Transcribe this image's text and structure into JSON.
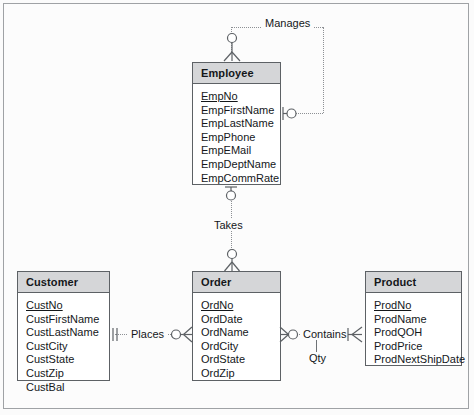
{
  "diagram": {
    "type": "entity-relationship-diagram",
    "notation": "crow's foot",
    "background_color": "#fcfcfc",
    "border_color": "#9fa2a5",
    "entity_header_color": "#d5d6d8",
    "entity_border_color": "#5d6165",
    "line_color": "#8d9094",
    "text_color": "#14171a"
  },
  "entities": [
    {
      "name": "Employee",
      "attributes": [
        {
          "label": "EmpNo",
          "primary_key": true
        },
        {
          "label": "EmpFirstName",
          "primary_key": false
        },
        {
          "label": "EmpLastName",
          "primary_key": false
        },
        {
          "label": "EmpPhone",
          "primary_key": false
        },
        {
          "label": "EmpEMail",
          "primary_key": false
        },
        {
          "label": "EmpDeptName",
          "primary_key": false
        },
        {
          "label": "EmpCommRate",
          "primary_key": false
        }
      ]
    },
    {
      "name": "Customer",
      "attributes": [
        {
          "label": "CustNo",
          "primary_key": true
        },
        {
          "label": "CustFirstName",
          "primary_key": false
        },
        {
          "label": "CustLastName",
          "primary_key": false
        },
        {
          "label": "CustCity",
          "primary_key": false
        },
        {
          "label": "CustState",
          "primary_key": false
        },
        {
          "label": "CustZip",
          "primary_key": false
        },
        {
          "label": "CustBal",
          "primary_key": false
        }
      ]
    },
    {
      "name": "Order",
      "attributes": [
        {
          "label": "OrdNo",
          "primary_key": true
        },
        {
          "label": "OrdDate",
          "primary_key": false
        },
        {
          "label": "OrdName",
          "primary_key": false
        },
        {
          "label": "OrdCity",
          "primary_key": false
        },
        {
          "label": "OrdState",
          "primary_key": false
        },
        {
          "label": "OrdZip",
          "primary_key": false
        }
      ]
    },
    {
      "name": "Product",
      "attributes": [
        {
          "label": "ProdNo",
          "primary_key": true
        },
        {
          "label": "ProdName",
          "primary_key": false
        },
        {
          "label": "ProdQOH",
          "primary_key": false
        },
        {
          "label": "ProdPrice",
          "primary_key": false
        },
        {
          "label": "ProdNextShipDate",
          "primary_key": false
        }
      ]
    }
  ],
  "relationships": [
    {
      "label": "Manages",
      "from_entity": "Employee",
      "to_entity": "Employee",
      "recursive": true,
      "from_cardinality": "zero-or-many",
      "to_cardinality": "zero-or-one"
    },
    {
      "label": "Takes",
      "from_entity": "Employee",
      "to_entity": "Order",
      "recursive": false,
      "from_cardinality": "zero-or-one",
      "to_cardinality": "zero-or-many"
    },
    {
      "label": "Places",
      "from_entity": "Customer",
      "to_entity": "Order",
      "recursive": false,
      "from_cardinality": "exactly-one",
      "to_cardinality": "zero-or-many"
    },
    {
      "label": "Contains",
      "from_entity": "Order",
      "to_entity": "Product",
      "recursive": false,
      "from_cardinality": "zero-or-many",
      "to_cardinality": "one-or-many",
      "relationship_attribute": "Qty"
    }
  ]
}
